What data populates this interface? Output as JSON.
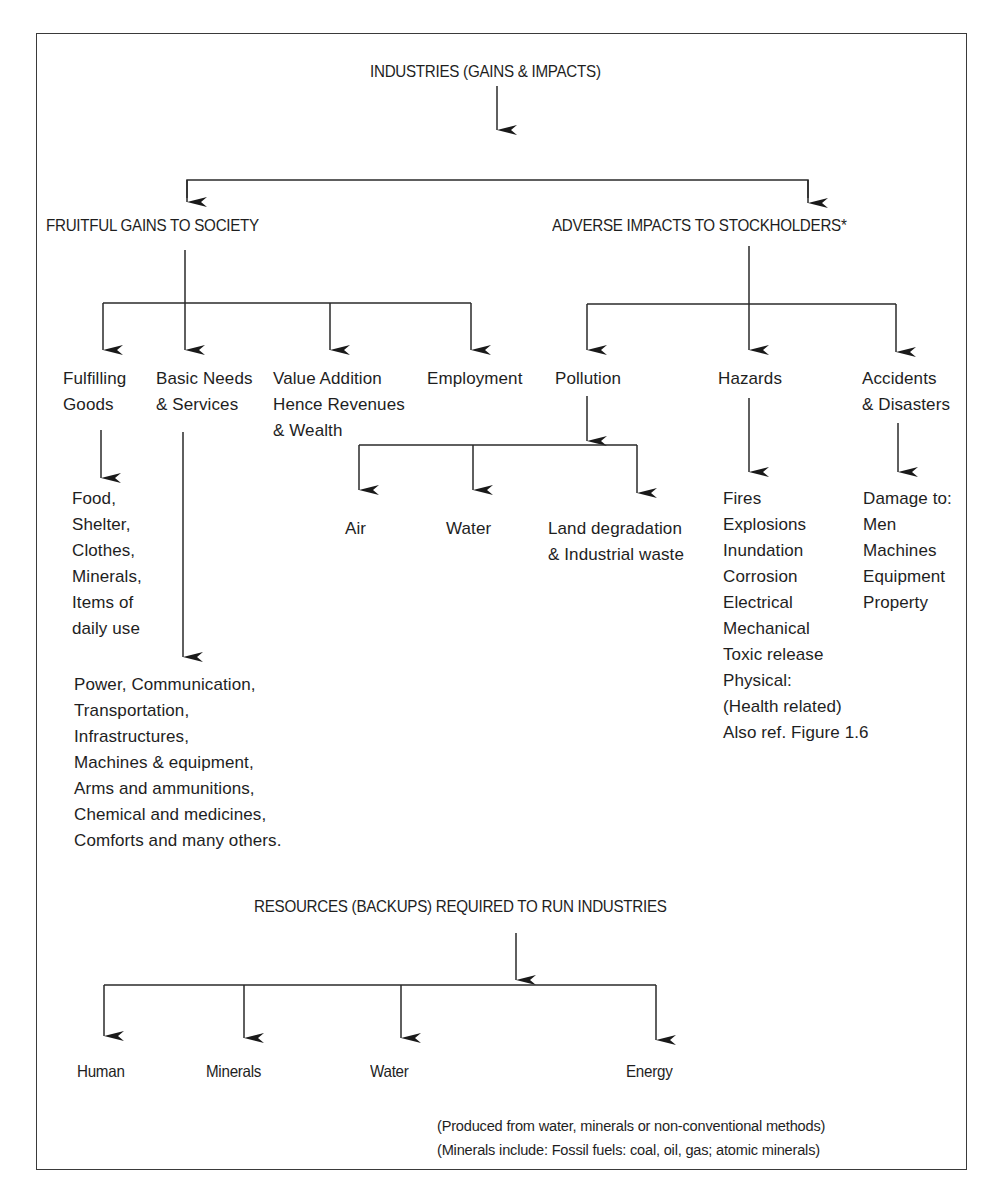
{
  "diagram": {
    "title": "INDUSTRIES (GAINS & IMPACTS)",
    "branches": {
      "gains": {
        "label": "FRUITFUL GAINS TO SOCIETY",
        "children": [
          {
            "label": "Fulfilling\nGoods",
            "details": "Food,\nShelter,\nClothes,\nMinerals,\nItems of\ndaily use"
          },
          {
            "label": "Basic Needs\n& Services",
            "details": "Power, Communication,\nTransportation,\nInfrastructures,\nMachines & equipment,\nArms and ammunitions,\nChemical and medicines,\nComforts and many others."
          },
          {
            "label": "Value Addition\nHence Revenues\n& Wealth"
          },
          {
            "label": "Employment"
          }
        ]
      },
      "impacts": {
        "label": "ADVERSE IMPACTS TO STOCKHOLDERS*",
        "children": [
          {
            "label": "Pollution",
            "sub": [
              {
                "label": "Air"
              },
              {
                "label": "Water"
              },
              {
                "label": "Land degradation\n& Industrial waste"
              }
            ]
          },
          {
            "label": "Hazards",
            "details": "Fires\nExplosions\nInundation\nCorrosion\nElectrical\nMechanical\nToxic release\nPhysical:\n(Health related)\nAlso ref. Figure 1.6"
          },
          {
            "label": "Accidents\n& Disasters",
            "details": "Damage to:\nMen\nMachines\nEquipment\nProperty"
          }
        ]
      }
    },
    "resources": {
      "label": "RESOURCES (BACKUPS) REQUIRED TO RUN INDUSTRIES",
      "children": [
        {
          "label": "Human"
        },
        {
          "label": "Minerals"
        },
        {
          "label": "Water"
        },
        {
          "label": "Energy"
        }
      ],
      "notes": [
        "(Produced from water, minerals or non-conventional methods)",
        "(Minerals include: Fossil fuels: coal, oil, gas; atomic minerals)"
      ]
    },
    "colors": {
      "line": "#2a2a2a",
      "text": "#1e1e1e",
      "frame": "#3a3a3a"
    }
  }
}
